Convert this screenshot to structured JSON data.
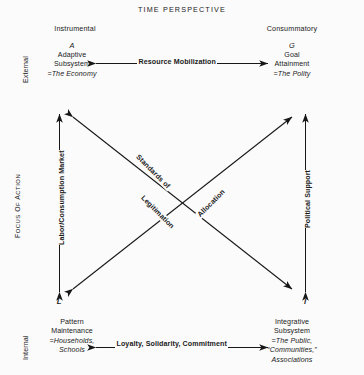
{
  "diagram": {
    "title": "TIME  PERSPECTIVE",
    "axis_labels": {
      "vertical_axis": "FOCUS OF ACTION",
      "vertical_axis_caps": "F",
      "vertical_axis_rest": "OCUS OF ACTION",
      "top_row": "External",
      "bottom_row": "Internal",
      "left_column": "Instrumental",
      "right_column": "Consummatory"
    },
    "cells": [
      {
        "id": "A",
        "key": "A",
        "lines": [
          "Adaptive",
          "Subsystem"
        ],
        "emphasis": "=The Economy",
        "corner": "top-left"
      },
      {
        "id": "G",
        "key": "G",
        "lines": [
          "Goal",
          "Attainment"
        ],
        "emphasis": "=The Polity",
        "corner": "top-right"
      },
      {
        "id": "L",
        "key": "L",
        "lines": [
          "Pattern",
          "Maintenance"
        ],
        "emphasis": "=Households,",
        "emphasis2": "Schools",
        "corner": "bottom-left"
      },
      {
        "id": "I",
        "key": "I",
        "lines": [
          "Integrative",
          "Subsystem"
        ],
        "emphasis": "=The Public,",
        "emphasis2": "“Communities,”",
        "emphasis3": "Associations",
        "corner": "bottom-right"
      }
    ],
    "corner_letters": {
      "bottom_left": "L",
      "bottom_right": "I"
    },
    "interchange_labels": {
      "top_horizontal": "Resource Mobilization",
      "bottom_horizontal": "Loyalty, Solidarity, Commitment",
      "left_vertical": "Labor/Consumption Market",
      "right_vertical": "Political Support",
      "diagonal_descending_1": "Standards of",
      "diagonal_descending_2": "Legitimation",
      "diagonal_ascending": "Allocation"
    },
    "colors": {
      "background": "#fbfbfb",
      "ink": "#1a1a1a",
      "arrow": "#171717"
    }
  }
}
